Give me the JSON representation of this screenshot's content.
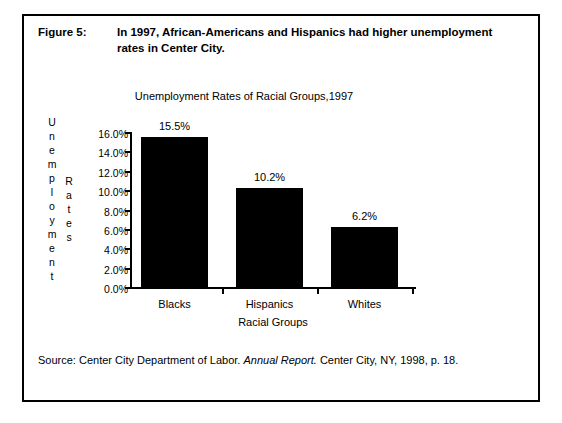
{
  "figure": {
    "label": "Figure 5:",
    "caption": "In 1997, African-Americans and Hispanics had higher unemployment rates in Center City."
  },
  "source": {
    "lead": "Source:  Center City Department of Labor. ",
    "publication": "Annual Report.",
    "tail": "  Center City, NY, 1998, p. 18."
  },
  "chart_data": {
    "type": "bar",
    "title": "Unemployment Rates of Racial Groups,1997",
    "xlabel": "Racial Groups",
    "ylabel": "Unemployment Rates",
    "categories": [
      "Blacks",
      "Hispanics",
      "Whites"
    ],
    "values": [
      15.5,
      10.2,
      6.2
    ],
    "value_labels": [
      "15.5%",
      "10.2%",
      "6.2%"
    ],
    "ylim": [
      0,
      16
    ],
    "ytick_values": [
      16.0,
      14.0,
      12.0,
      10.0,
      8.0,
      6.0,
      4.0,
      2.0,
      0.0
    ],
    "ytick_labels": [
      "16.0%",
      "14.0%",
      "12.0%",
      "10.0%",
      "8.0%",
      "6.0%",
      "4.0%",
      "2.0%",
      "0.0%"
    ],
    "grid": false,
    "legend": false,
    "bar_color": "#000000",
    "axis_color": "#000000"
  }
}
